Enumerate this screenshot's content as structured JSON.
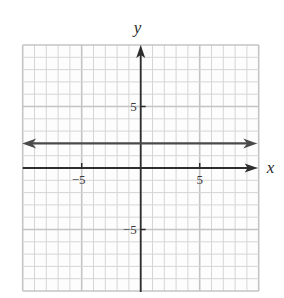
{
  "chart_data": {
    "type": "line",
    "title": "",
    "xlabel": "x",
    "ylabel": "y",
    "xlim": [
      -10,
      10
    ],
    "ylim": [
      -10,
      10
    ],
    "grid": true,
    "grid_step": 1,
    "major_grid_step": 5,
    "x_ticks": [
      {
        "value": -5,
        "label": "−5"
      },
      {
        "value": 5,
        "label": "5"
      }
    ],
    "y_ticks": [
      {
        "value": 5,
        "label": "5"
      },
      {
        "value": -5,
        "label": "−5"
      }
    ],
    "series": [
      {
        "name": "y = 2",
        "equation": "y = 2",
        "x": [
          -10,
          10
        ],
        "y": [
          2,
          2
        ],
        "arrows": "both"
      }
    ],
    "legend": null
  },
  "colors": {
    "grid": "#d6d6d6",
    "grid_major": "#c4c4c4",
    "axis": "#2e2e2e",
    "line": "#4a4a4a",
    "label": "#2a2a2a"
  },
  "layout": {
    "origin_px": [
      140.7,
      168
    ],
    "unit_x_px": 11.8,
    "unit_y_px": 12.3
  }
}
